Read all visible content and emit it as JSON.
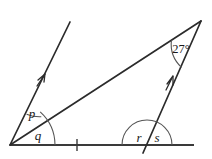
{
  "figure": {
    "type": "geometry-diagram",
    "background_color": "#ffffff",
    "line_color": "#2b2b2b",
    "arc_color": "#555555",
    "label_color": "#1a1a1a"
  },
  "labels": {
    "angle_p": "p",
    "angle_q": "q",
    "angle_r": "r",
    "angle_s": "s",
    "angle_apex": "27°"
  },
  "points": {
    "left_vertex": {
      "x": 10,
      "y": 145
    },
    "apex": {
      "x": 201,
      "y": 21
    },
    "base_right_end": {
      "x": 194,
      "y": 145
    },
    "left_ray_top": {
      "x": 70,
      "y": 22
    },
    "right_line_base": {
      "x": 147,
      "y": 145
    }
  },
  "marks": {
    "base_tick": {
      "x": 77,
      "y": 145,
      "count": 1
    },
    "left_ray_arrow": {
      "x": 43,
      "y": 77
    },
    "right_line_arrow": {
      "x": 172,
      "y": 79
    },
    "parallel_arrow_count": 1
  },
  "angles": [
    {
      "name": "p",
      "vertex": "left_vertex",
      "arc_radius": 34,
      "label_x": 32,
      "label_y": 118
    },
    {
      "name": "q",
      "vertex": "left_vertex",
      "arc_radius": 45,
      "label_x": 38,
      "label_y": 139
    },
    {
      "name": "r",
      "vertex": "right_line_base",
      "arc_radius": 25,
      "label_x": 139,
      "label_y": 141
    },
    {
      "name": "s",
      "vertex": "right_line_base",
      "arc_radius": 25,
      "label_x": 157,
      "label_y": 141
    },
    {
      "name": "27°",
      "vertex": "apex",
      "arc_radius": 32,
      "label_x": 168,
      "label_y": 52
    }
  ]
}
